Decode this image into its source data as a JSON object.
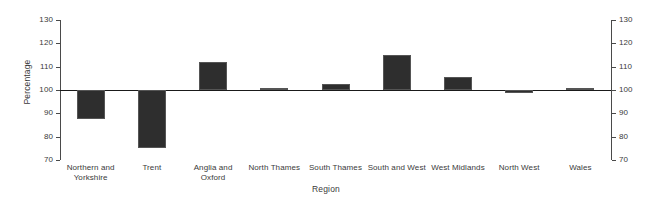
{
  "chart_data": {
    "type": "bar",
    "title": "",
    "xlabel": "Region",
    "ylabel": "Percentage",
    "categories": [
      "Northern and Yorkshire",
      "Trent",
      "Anglia and Oxford",
      "North Thames",
      "South Thames",
      "South and West",
      "West Midlands",
      "North West",
      "Wales"
    ],
    "values": [
      87.5,
      75,
      112,
      100.7,
      102.5,
      115,
      105.5,
      98.8,
      101
    ],
    "baseline": 100,
    "ylim": [
      70,
      130
    ],
    "yticks": [
      70,
      80,
      90,
      100,
      110,
      120,
      130
    ],
    "right_axis_yticks": [
      70,
      80,
      90,
      100,
      110,
      120,
      130
    ],
    "grid": false,
    "legend": "none",
    "bar_color": "#2e2e2e",
    "axis_color": "#4a4a4a",
    "baseline_color": "#1a1a1a"
  }
}
